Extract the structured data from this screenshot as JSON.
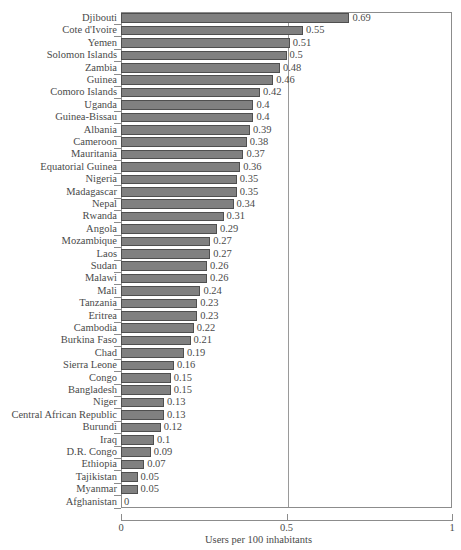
{
  "chart_data": {
    "type": "bar",
    "orientation": "horizontal",
    "title": "",
    "subtitle": "",
    "xlabel": "Users per 100 inhabitants",
    "ylabel": "",
    "xlim": [
      0,
      1
    ],
    "xticks": [
      "0",
      "0.5",
      "1"
    ],
    "xtick_values": [
      0,
      0.5,
      1
    ],
    "grid": "vertical gridline at 0.5",
    "legend": "none",
    "bar_color": "#808080",
    "bar_border_color": "#4f4f4f",
    "axis_color": "#8c8c8c",
    "text_color": "#4a4a4a",
    "categories": [
      "Djibouti",
      "Cote d'Ivoire",
      "Yemen",
      "Solomon Islands",
      "Zambia",
      "Guinea",
      "Comoro Islands",
      "Uganda",
      "Guinea-Bissau",
      "Albania",
      "Cameroon",
      "Mauritania",
      "Equatorial Guinea",
      "Nigeria",
      "Madagascar",
      "Nepal",
      "Rwanda",
      "Angola",
      "Mozambique",
      "Laos",
      "Sudan",
      "Malawi",
      "Mali",
      "Tanzania",
      "Eritrea",
      "Cambodia",
      "Burkina Faso",
      "Chad",
      "Sierra Leone",
      "Congo",
      "Bangladesh",
      "Niger",
      "Central African Republic",
      "Burundi",
      "Iraq",
      "D.R. Congo",
      "Ethiopia",
      "Tajikistan",
      "Myanmar",
      "Afghanistan"
    ],
    "values": [
      0.69,
      0.55,
      0.51,
      0.5,
      0.48,
      0.46,
      0.42,
      0.4,
      0.4,
      0.39,
      0.38,
      0.37,
      0.36,
      0.35,
      0.35,
      0.34,
      0.31,
      0.29,
      0.27,
      0.27,
      0.26,
      0.26,
      0.24,
      0.23,
      0.23,
      0.22,
      0.21,
      0.19,
      0.16,
      0.15,
      0.15,
      0.13,
      0.13,
      0.12,
      0.1,
      0.09,
      0.07,
      0.05,
      0.05,
      0
    ],
    "value_labels": [
      "0.69",
      "0.55",
      "0.51",
      "0.5",
      "0.48",
      "0.46",
      "0.42",
      "0.4",
      "0.4",
      "0.39",
      "0.38",
      "0.37",
      "0.36",
      "0.35",
      "0.35",
      "0.34",
      "0.31",
      "0.29",
      "0.27",
      "0.27",
      "0.26",
      "0.26",
      "0.24",
      "0.23",
      "0.23",
      "0.22",
      "0.21",
      "0.19",
      "0.16",
      "0.15",
      "0.15",
      "0.13",
      "0.13",
      "0.12",
      "0.1",
      "0.09",
      "0.07",
      "0.05",
      "0.05",
      "0"
    ]
  }
}
